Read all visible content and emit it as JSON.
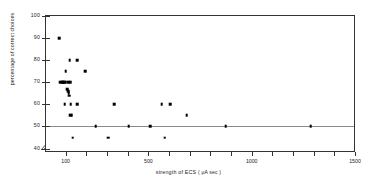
{
  "figure": {
    "background": "#ffffff",
    "point_color": "#000000",
    "axis_color": "#333333",
    "reference_line_color": "#8a8a8a"
  },
  "axes": {
    "y": {
      "title": "percentage of correct choices",
      "ticks": [
        100,
        90,
        80,
        70,
        60,
        50,
        40
      ],
      "tick_labels": [
        "100",
        "90",
        "80",
        "70",
        "60",
        "50",
        "40"
      ],
      "range": [
        38,
        100
      ],
      "break_symbol": "//"
    },
    "x": {
      "title_main": "strength of ECS",
      "title_unit": "( µA sec )",
      "title": "strength of ECS ( µA sec )",
      "labeled_ticks": [
        100,
        500,
        1000,
        1500
      ],
      "tick_labels": [
        "100",
        "500",
        "1000",
        "1500"
      ],
      "minor_tick_step": 100,
      "range": [
        0,
        1500
      ]
    }
  },
  "reference_line": {
    "y": 50,
    "label": "chance level"
  },
  "chart_data": {
    "type": "scatter",
    "title": "",
    "xlabel": "strength of ECS ( µA sec )",
    "ylabel": "percentage of correct choices",
    "xlim": [
      0,
      1500
    ],
    "ylim": [
      38,
      100
    ],
    "grid": false,
    "legend": null,
    "reference_lines": [
      {
        "axis": "y",
        "value": 50
      }
    ],
    "x": [
      65,
      95,
      115,
      150,
      80,
      70,
      75,
      82,
      88,
      95,
      105,
      118,
      105,
      108,
      110,
      112,
      90,
      120,
      150,
      190,
      118,
      122,
      330,
      560,
      590,
      660,
      240,
      400,
      500,
      870,
      1280,
      130,
      295,
      570
    ],
    "y": [
      90,
      75,
      80,
      80,
      70,
      70,
      70,
      70,
      70,
      70,
      70,
      70,
      67,
      66,
      65,
      64,
      60,
      60,
      60,
      75,
      55,
      55,
      60,
      60,
      60,
      55,
      50,
      50,
      50,
      50,
      50,
      45,
      45,
      45
    ],
    "points": [
      {
        "x": 65,
        "y": 90
      },
      {
        "x": 95,
        "y": 75
      },
      {
        "x": 115,
        "y": 80
      },
      {
        "x": 150,
        "y": 80
      },
      {
        "x": 190,
        "y": 75
      },
      {
        "x": 70,
        "y": 70
      },
      {
        "x": 75,
        "y": 70
      },
      {
        "x": 80,
        "y": 70
      },
      {
        "x": 84,
        "y": 70
      },
      {
        "x": 88,
        "y": 70
      },
      {
        "x": 95,
        "y": 70
      },
      {
        "x": 106,
        "y": 70
      },
      {
        "x": 118,
        "y": 70
      },
      {
        "x": 104,
        "y": 67
      },
      {
        "x": 107,
        "y": 66
      },
      {
        "x": 110,
        "y": 65
      },
      {
        "x": 112,
        "y": 64
      },
      {
        "x": 90,
        "y": 60
      },
      {
        "x": 120,
        "y": 60
      },
      {
        "x": 150,
        "y": 60
      },
      {
        "x": 330,
        "y": 60
      },
      {
        "x": 560,
        "y": 60
      },
      {
        "x": 600,
        "y": 60
      },
      {
        "x": 118,
        "y": 55
      },
      {
        "x": 124,
        "y": 55
      },
      {
        "x": 680,
        "y": 55
      },
      {
        "x": 240,
        "y": 50
      },
      {
        "x": 400,
        "y": 50
      },
      {
        "x": 505,
        "y": 50
      },
      {
        "x": 870,
        "y": 50
      },
      {
        "x": 1280,
        "y": 50
      },
      {
        "x": 130,
        "y": 45
      },
      {
        "x": 300,
        "y": 45
      },
      {
        "x": 575,
        "y": 45
      }
    ]
  }
}
